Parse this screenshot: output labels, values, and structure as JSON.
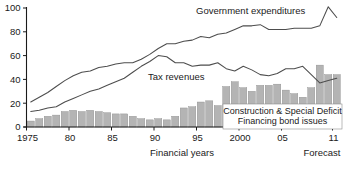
{
  "chart_data": {
    "type": "bar",
    "title": "",
    "xlabel": "Financial years",
    "ylabel": "",
    "ylim": [
      0,
      100
    ],
    "xlim": [
      1975,
      2011
    ],
    "grid": false,
    "legend_position": "inline-annotations",
    "y_ticks": [
      "0",
      "20",
      "40",
      "60",
      "80",
      "100"
    ],
    "y_tick_values": [
      0,
      20,
      40,
      60,
      80,
      100
    ],
    "x_ticks": [
      "1975",
      "80",
      "85",
      "90",
      "95",
      "2000",
      "05",
      "11"
    ],
    "x_tick_values": [
      1975,
      1980,
      1985,
      1990,
      1995,
      2000,
      2005,
      2011
    ],
    "forecast_note": "Forecast",
    "categories": [
      1975,
      1976,
      1977,
      1978,
      1979,
      1980,
      1981,
      1982,
      1983,
      1984,
      1985,
      1986,
      1987,
      1988,
      1989,
      1990,
      1991,
      1992,
      1993,
      1994,
      1995,
      1996,
      1997,
      1998,
      1999,
      2000,
      2001,
      2002,
      2003,
      2004,
      2005,
      2006,
      2007,
      2008,
      2009,
      2010,
      2011
    ],
    "series": [
      {
        "name": "Government expenditures",
        "type": "line",
        "values": [
          21,
          25,
          29,
          34,
          39,
          43,
          46,
          47,
          50,
          51,
          53,
          54,
          54,
          57,
          61,
          66,
          70,
          70,
          72,
          73,
          76,
          75,
          78,
          79,
          82,
          85,
          85,
          86,
          82,
          82,
          82,
          83,
          83,
          83,
          85,
          101,
          92
        ]
      },
      {
        "name": "Tax revenues",
        "type": "line",
        "values": [
          13,
          14,
          16,
          17,
          21,
          24,
          27,
          30,
          32,
          35,
          38,
          41,
          46,
          51,
          55,
          60,
          59,
          54,
          54,
          51,
          52,
          52,
          54,
          49,
          47,
          51,
          48,
          44,
          43,
          45,
          49,
          49,
          51,
          44,
          37,
          39,
          41
        ]
      }
    ],
    "bars": {
      "name": "Construction & Special Deficit Financing bond issues",
      "label_line1": "Construction & Special Deficit",
      "label_line2": "Financing bond issues",
      "values": [
        5,
        7,
        9,
        10,
        13,
        14,
        13,
        14,
        13,
        12,
        11,
        11,
        9,
        7,
        6,
        7,
        6,
        9,
        16,
        17,
        21,
        22,
        18,
        34,
        38,
        33,
        30,
        35,
        35,
        36,
        31,
        28,
        25,
        33,
        52,
        44,
        44
      ]
    },
    "colors": {
      "bar_fill": "#b4b4b4",
      "bar_stroke": "#8c8c8c",
      "line": "#4d4d4d",
      "axis": "#1a1a1a",
      "text": "#1a1a1a",
      "background": "#ffffff"
    }
  }
}
